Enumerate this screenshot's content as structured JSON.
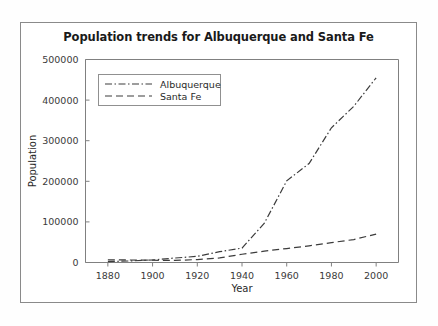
{
  "figure": {
    "title": "Population trends for Albuquerque and Santa Fe",
    "background_color": "#ffffff",
    "frame_color": "#8a8a8a"
  },
  "axes": {
    "xlabel": "Year",
    "ylabel": "Population",
    "x_ticks": [
      "1880",
      "1900",
      "1920",
      "1940",
      "1960",
      "1980",
      "2000"
    ],
    "y_ticks": [
      "0",
      "100000",
      "200000",
      "300000",
      "400000",
      "500000"
    ]
  },
  "legend": {
    "entries": [
      {
        "label": "Albuquerque",
        "style": "dash-dot"
      },
      {
        "label": "Santa Fe",
        "style": "dashed"
      }
    ]
  },
  "chart_data": {
    "type": "line",
    "title": "Population trends for Albuquerque and Santa Fe",
    "xlabel": "Year",
    "ylabel": "Population",
    "xlim": [
      1870,
      2010
    ],
    "ylim": [
      0,
      500000
    ],
    "grid": false,
    "legend_position": "upper left",
    "x": [
      1880,
      1890,
      1900,
      1910,
      1920,
      1930,
      1940,
      1950,
      1960,
      1970,
      1980,
      1990,
      2000
    ],
    "series": [
      {
        "name": "Albuquerque",
        "line_style": "dash-dot",
        "color": "#3c3c3c",
        "values": [
          2315,
          3785,
          6238,
          11020,
          15157,
          26570,
          35449,
          96815,
          201189,
          243751,
          331767,
          384736,
          455000
        ]
      },
      {
        "name": "Santa Fe",
        "line_style": "dashed",
        "color": "#3c3c3c",
        "values": [
          6635,
          6185,
          5603,
          5072,
          7236,
          11176,
          20325,
          27998,
          34394,
          41167,
          48953,
          56537,
          70000
        ]
      }
    ]
  }
}
